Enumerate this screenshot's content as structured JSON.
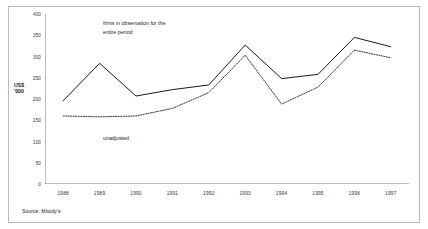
{
  "chart_data": {
    "type": "line",
    "title": "",
    "xlabel": "",
    "ylabel": "US$\n'000",
    "categories": [
      "1988",
      "1989",
      "1990",
      "1991",
      "1992",
      "1993",
      "1994",
      "1995",
      "1996",
      "1997"
    ],
    "ylim": [
      0,
      400
    ],
    "yticks": [
      0,
      50,
      100,
      150,
      200,
      250,
      300,
      350,
      400
    ],
    "grid": false,
    "legend_position": "inline-annotation",
    "series": [
      {
        "name": "firms in observation for the entire period",
        "style": "solid",
        "color": "#1a1a1a",
        "values": [
          196,
          284,
          207,
          222,
          233,
          327,
          248,
          258,
          345,
          323
        ]
      },
      {
        "name": "unadjusted",
        "style": "dotted",
        "color": "#1a1a1a",
        "values": [
          160,
          158,
          160,
          178,
          215,
          303,
          188,
          228,
          315,
          297
        ]
      }
    ],
    "annotations": [
      {
        "id": "entire-period",
        "text": "firms in observation for the\nentire period"
      },
      {
        "id": "unadjusted",
        "text": "unadjusted"
      }
    ],
    "source_note": "Source: Moody's"
  }
}
